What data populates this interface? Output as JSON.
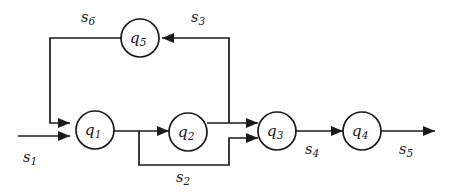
{
  "diagram": {
    "type": "finite-state-machine",
    "title": "",
    "background_color": "#ffffff",
    "stroke_color": "#1a1a1a",
    "nodes": [
      {
        "id": "q1",
        "base": "q",
        "sub": "1",
        "cx": 95,
        "cy": 130,
        "r": 19
      },
      {
        "id": "q2",
        "base": "q",
        "sub": "2",
        "cx": 188,
        "cy": 132,
        "r": 19
      },
      {
        "id": "q3",
        "base": "q",
        "sub": "3",
        "cx": 277,
        "cy": 131,
        "r": 19
      },
      {
        "id": "q4",
        "base": "q",
        "sub": "4",
        "cx": 362,
        "cy": 131,
        "r": 19
      },
      {
        "id": "q5",
        "base": "q",
        "sub": "5",
        "cx": 140,
        "cy": 38,
        "r": 19
      }
    ],
    "edges": [
      {
        "id": "s1",
        "base": "s",
        "sub": "1",
        "from": "input",
        "to": "q1",
        "label_x": 30,
        "label_y": 158
      },
      {
        "id": "s2",
        "base": "s",
        "sub": "2",
        "from": "q1-q2",
        "to": "q3",
        "label_x": 183,
        "label_y": 178
      },
      {
        "id": "s3",
        "base": "s",
        "sub": "3",
        "from": "q2-q3",
        "to": "q5",
        "label_x": 198,
        "label_y": 18
      },
      {
        "id": "s4",
        "base": "s",
        "sub": "4",
        "from": "q3",
        "to": "q4",
        "label_x": 312,
        "label_y": 150
      },
      {
        "id": "s5",
        "base": "s",
        "sub": "5",
        "from": "q4",
        "to": "output",
        "label_x": 406,
        "label_y": 150
      },
      {
        "id": "s6",
        "base": "s",
        "sub": "6",
        "from": "q5",
        "to": "q1",
        "label_x": 88,
        "label_y": 18
      }
    ]
  }
}
